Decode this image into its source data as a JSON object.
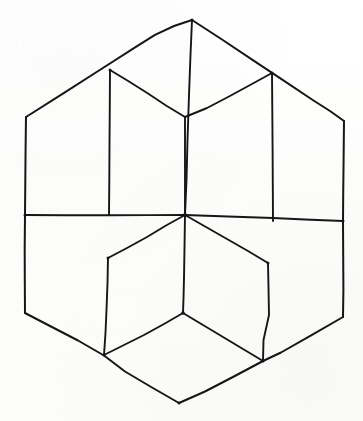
{
  "figure": {
    "title": "Tumbling blocks / Necker cube hexagon illusion",
    "description": "A regular hexagon outline subdivided by interior lines into three rhombi, each rhombus further split, producing an ambiguous line drawing that can be read as a stack of cubes in two different orientations.",
    "caption": "",
    "medium": "hand-drawn ink line drawing",
    "background_color": "#fefefe",
    "ink_color": "#161616",
    "stroke_width_px": 1.9,
    "canvas": {
      "width": 363,
      "height": 421
    }
  },
  "geometry": {
    "units": "pixels",
    "vertices": {
      "top_apex": [
        192,
        20
      ],
      "upper_left_corner": [
        26,
        117
      ],
      "upper_right_corner": [
        344,
        121
      ],
      "left_middle_corner": [
        25,
        215
      ],
      "right_middle_corner": [
        343,
        221
      ],
      "lower_left_corner": [
        25,
        313
      ],
      "lower_right_corner": [
        343,
        317
      ],
      "bottom_apex": [
        179,
        403
      ],
      "center_junction": [
        185,
        215
      ],
      "upper_left_inner": [
        110,
        70
      ],
      "upper_right_inner": [
        272,
        73
      ],
      "lower_left_inner": [
        108,
        258
      ],
      "lower_right_inner": [
        268,
        263
      ],
      "bottom_inner": [
        183,
        313
      ],
      "bottom_left_edge": [
        104,
        355
      ],
      "bottom_right_edge": [
        263,
        361
      ]
    },
    "outer_hexagon_path": "M 192 20 L 344 121 L 343 317 L 179 403 L 25 313 L 26 117 Z",
    "interior_segments": [
      {
        "name": "center-to-top-apex",
        "from": "center_junction",
        "to": "top_apex"
      },
      {
        "name": "center-to-left-middle",
        "from": "center_junction",
        "to": "left_middle_corner"
      },
      {
        "name": "center-to-right-middle",
        "from": "center_junction",
        "to": "right_middle_corner"
      },
      {
        "name": "center-to-upper-left-inner",
        "from": "center_junction",
        "to": "upper_left_inner"
      },
      {
        "name": "center-to-upper-right-inner",
        "from": "center_junction",
        "to": "upper_right_inner"
      },
      {
        "name": "center-to-lower-left-inner",
        "from": "center_junction",
        "to": "lower_left_inner"
      },
      {
        "name": "center-to-lower-right-inner",
        "from": "center_junction",
        "to": "lower_right_inner"
      },
      {
        "name": "upper-left-inner-vertical",
        "from": "upper_left_inner",
        "to": "left_middle_corner"
      },
      {
        "name": "upper-right-inner-vertical",
        "from": "upper_right_inner",
        "to": "right_middle_corner"
      },
      {
        "name": "lower-left-inner-vertical",
        "from": "lower_left_inner",
        "to": "bottom_left_edge"
      },
      {
        "name": "lower-right-inner-vertical",
        "from": "lower_right_inner",
        "to": "bottom_right_edge"
      },
      {
        "name": "bottom-inner-vertical",
        "from": "center_junction",
        "to": "bottom_inner"
      },
      {
        "name": "bottom-inner-to-left-edge",
        "from": "bottom_inner",
        "to": "bottom_left_edge"
      },
      {
        "name": "bottom-inner-to-right-edge",
        "from": "bottom_inner",
        "to": "bottom_right_edge"
      }
    ],
    "rhombi": [
      {
        "name": "top-rhombus",
        "corners": [
          "upper_left_inner",
          "top_apex",
          "upper_right_inner",
          "center_junction"
        ]
      },
      {
        "name": "upper-left-rhombus",
        "corners": [
          "left_middle_corner",
          "upper_left_corner",
          "upper_left_inner",
          "center_junction"
        ]
      },
      {
        "name": "upper-right-rhombus",
        "corners": [
          "center_junction",
          "upper_right_inner",
          "upper_right_corner",
          "right_middle_corner"
        ]
      },
      {
        "name": "left-rhombus",
        "corners": [
          "left_middle_corner",
          "center_junction",
          "lower_left_inner",
          "bottom_left_edge"
        ]
      },
      {
        "name": "right-rhombus",
        "corners": [
          "center_junction",
          "right_middle_corner",
          "bottom_right_edge",
          "lower_right_inner"
        ]
      },
      {
        "name": "lower-left-rhombus",
        "corners": [
          "lower_left_inner",
          "center_junction",
          "bottom_inner",
          "bottom_left_edge"
        ]
      },
      {
        "name": "lower-right-rhombus",
        "corners": [
          "center_junction",
          "lower_right_inner",
          "bottom_right_edge",
          "bottom_inner"
        ]
      },
      {
        "name": "bottom-left-face",
        "corners": [
          "bottom_left_edge",
          "bottom_inner",
          "bottom_apex",
          "lower_left_corner"
        ]
      },
      {
        "name": "bottom-right-face",
        "corners": [
          "bottom_inner",
          "bottom_right_edge",
          "lower_right_corner",
          "bottom_apex"
        ]
      }
    ]
  },
  "labels": {
    "none_present": "This figure contains no text, axis labels, legend, or numeric annotations."
  }
}
